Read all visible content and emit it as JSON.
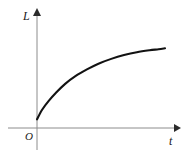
{
  "figure": {
    "background_color": "#ffffff",
    "axis_color": "#8c8c8c",
    "curve_color": "#121212",
    "label_color": "#1a1a1a"
  },
  "labels": {
    "y_axis": "L",
    "x_axis": "t",
    "origin": "O"
  },
  "icons": {
    "y_axis_arrow": "arrow-up-icon",
    "x_axis_arrow": "arrow-right-icon"
  },
  "chart_data": {
    "type": "line",
    "title": "",
    "xlabel": "t",
    "ylabel": "L",
    "grid": false,
    "legend": null,
    "axis_arrows": true,
    "origin_label": "O",
    "xlim": [
      0,
      1
    ],
    "ylim": [
      0,
      1
    ],
    "tick_labels": {
      "x": [],
      "y": []
    },
    "series": [
      {
        "name": "L(t)",
        "description": "increasing concave-down curve starting above origin, flattening toward an asymptote",
        "x": [
          0.0,
          0.04,
          0.09,
          0.15,
          0.22,
          0.3,
          0.39,
          0.48,
          0.58,
          0.68,
          0.78,
          0.88,
          0.95,
          1.0
        ],
        "y": [
          0.09,
          0.19,
          0.28,
          0.37,
          0.46,
          0.54,
          0.61,
          0.67,
          0.72,
          0.76,
          0.79,
          0.81,
          0.82,
          0.83
        ]
      }
    ]
  }
}
